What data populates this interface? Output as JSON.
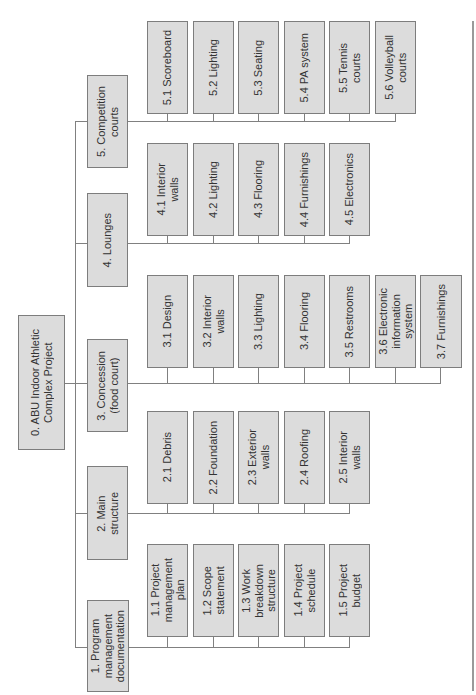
{
  "diagram": {
    "type": "work-breakdown-structure",
    "orientation": "rotated-90-ccw",
    "colors": {
      "box_fill": "#dcdcdc",
      "box_border": "#7d7d7d",
      "line": "#808080",
      "text": "#333333"
    },
    "root": {
      "label": "0. ABU Indoor Athletic\nComplex Project"
    },
    "branches": [
      {
        "label": "1. Program\nmanagement\ndocumentation",
        "children": [
          "1.1 Project\nmanagement\nplan",
          "1.2 Scope\nstatement",
          "1.3 Work\nbreakdown\nstructure",
          "1.4 Project\nschedule",
          "1.5 Project\nbudget"
        ]
      },
      {
        "label": "2. Main\nstructure",
        "children": [
          "2.1 Debris",
          "2.2 Foundation",
          "2.3 Exterior\nwalls",
          "2.4 Roofing",
          "2.5 Interior\nwalls"
        ]
      },
      {
        "label": "3. Concession\n(food court)",
        "children": [
          "3.1 Design",
          "3.2 Interior\nwalls",
          "3.3 Lighting",
          "3.4 Flooring",
          "3.5 Restrooms",
          "3.6 Electronic\ninformation\nsystem",
          "3.7 Furnishings"
        ]
      },
      {
        "label": "4. Lounges",
        "children": [
          "4.1 Interior\nwalls",
          "4.2 Lighting",
          "4.3 Flooring",
          "4.4 Furnishings",
          "4.5 Electronics"
        ]
      },
      {
        "label": "5. Competition\ncourts",
        "children": [
          "5.1 Scoreboard",
          "5.2 Lighting",
          "5.3 Seating",
          "5.4 PA system",
          "5.5 Tennis\ncourts",
          "5.6 Volleyball\ncourts"
        ]
      }
    ]
  }
}
